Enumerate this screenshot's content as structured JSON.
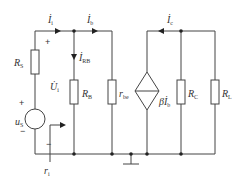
{
  "diagram": {
    "type": "small-signal equivalent circuit",
    "components": [
      {
        "id": "RS",
        "label": "R",
        "sub": "S"
      },
      {
        "id": "RB",
        "label": "R",
        "sub": "B"
      },
      {
        "id": "rbe",
        "label": "r",
        "sub": "be"
      },
      {
        "id": "CCCS",
        "label": "βİ",
        "sub": "b"
      },
      {
        "id": "RC",
        "label": "R",
        "sub": "C"
      },
      {
        "id": "RL",
        "label": "R",
        "sub": "L"
      },
      {
        "id": "uS",
        "label": "u",
        "sub": "S"
      }
    ],
    "currents": [
      {
        "id": "Ii",
        "label": "İ",
        "sub": "i"
      },
      {
        "id": "Ib",
        "label": "İ",
        "sub": "b"
      },
      {
        "id": "IRB",
        "label": "İ",
        "sub": "RB"
      },
      {
        "id": "Ic",
        "label": "İ",
        "sub": "c"
      }
    ],
    "voltages": [
      {
        "id": "Ui",
        "label": "U̇",
        "sub": "i"
      }
    ],
    "resistance_marker": {
      "label": "r",
      "sub": "i"
    },
    "signs": {
      "plus": "+",
      "minus": "−"
    }
  }
}
